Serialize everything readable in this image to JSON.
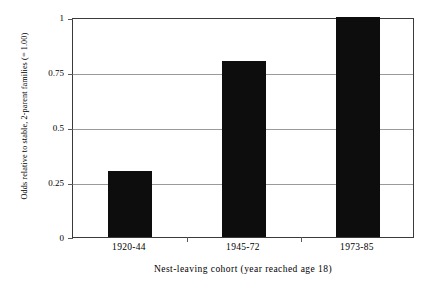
{
  "chart_data": {
    "type": "bar",
    "title": "",
    "categories": [
      "1920-44",
      "1945-72",
      "1973-85"
    ],
    "values": [
      0.3,
      0.8,
      1.0
    ],
    "series": [
      {
        "name": "Odds relative to stable, 2-parent families",
        "values": [
          0.3,
          0.8,
          1.0
        ]
      }
    ],
    "xlabel": "Nest-leaving cohort (year reached age 18)",
    "ylabel": "Odds relative to stable, 2-parent families (= 1.00)",
    "ylim": [
      0,
      1
    ],
    "yticks": [
      0,
      0.25,
      0.5,
      0.75,
      1
    ],
    "ytick_labels": [
      "0",
      "0.25",
      "0.5",
      "0.75",
      "1"
    ],
    "grid": true,
    "grid_axis": "y",
    "legend": false,
    "legend_position": "none",
    "bar_color": "#0d0d0d",
    "gridline_color": "#9a9a9a",
    "frame_color": "#3a3a3a",
    "background_color": "#ffffff"
  }
}
